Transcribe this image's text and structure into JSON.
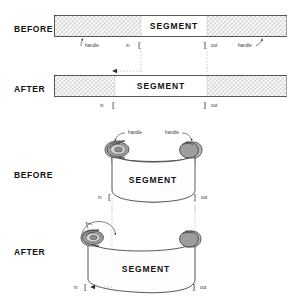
{
  "diagram": {
    "colors": {
      "ink": "#1a1a1a",
      "outline": "#2d2d2d",
      "guide": "#b9b9b9",
      "hatch": "#9a9a9a",
      "roll": "#b4b4b4",
      "roll_cap": "#9d9d9d",
      "background": "#ffffff"
    },
    "rows": {
      "before_label": "BEFORE",
      "after_label": "AFTER"
    },
    "labels": {
      "segment": "SEGMENT",
      "handle": "handle",
      "in": "in",
      "out": "out",
      "bracket_in": "[",
      "bracket_out": "]"
    },
    "flat": {
      "before": {
        "row_label": "BEFORE",
        "segment_label": "SEGMENT",
        "left_handle_label": "handle",
        "right_handle_label": "handle",
        "in_label": "in",
        "out_label": "out",
        "in_bracket": "[",
        "out_bracket": "]"
      },
      "after": {
        "row_label": "AFTER",
        "segment_label": "SEGMENT",
        "in_label": "in",
        "out_label": "out",
        "in_bracket": "[",
        "out_bracket": "]"
      }
    },
    "roll": {
      "before": {
        "row_label": "BEFORE",
        "segment_label": "SEGMENT",
        "left_handle_label": "handle",
        "right_handle_label": "handle",
        "in_label": "in",
        "out_label": "out",
        "in_bracket": "[",
        "out_bracket": "]"
      },
      "after": {
        "row_label": "AFTER",
        "segment_label": "SEGMENT",
        "in_label": "in",
        "out_label": "out",
        "in_bracket": "[",
        "out_bracket": "]"
      }
    }
  }
}
